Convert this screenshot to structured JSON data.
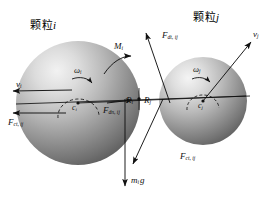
{
  "figure": {
    "type": "force-diagram",
    "background_color": "#ffffff",
    "sphere_fill_light": "#e8e8e8",
    "sphere_fill_dark": "#6a6a6a",
    "arrow_color": "#1a1a1a"
  },
  "titles": {
    "particle_i": "颗粒",
    "particle_i_index": "i",
    "particle_j": "颗粒",
    "particle_j_index": "j"
  },
  "particles": [
    {
      "id": "i",
      "label": "颗粒i",
      "center_label": "c",
      "center_sub": "i",
      "radius_label": "R",
      "radius_sub": "i",
      "cx": 78,
      "cy": 103,
      "r": 62
    },
    {
      "id": "j",
      "label": "颗粒j",
      "center_label": "c",
      "center_sub": "j",
      "radius_label": "R",
      "radius_sub": "j",
      "cx": 203,
      "cy": 101,
      "r": 44
    }
  ],
  "vectors": [
    {
      "name": "velocity-i",
      "symbol": "v",
      "sub": "i",
      "label": "v_i",
      "direction": "left",
      "from": [
        74,
        91
      ],
      "to": [
        12,
        91
      ]
    },
    {
      "name": "velocity-j",
      "symbol": "v",
      "sub": "j",
      "label": "v_j",
      "direction": "upper-right",
      "from": [
        203,
        101
      ],
      "to": [
        258,
        38
      ]
    },
    {
      "name": "contact-tangential-force-i",
      "symbol": "F",
      "sub": "ct, ij",
      "label": "F_ct, ij",
      "direction": "left",
      "from": [
        62,
        112
      ],
      "to": [
        12,
        112
      ]
    },
    {
      "name": "damping-normal-force-i",
      "symbol": "F",
      "sub": "dn, ij",
      "label": "F_dn, ij",
      "direction": "right",
      "from": [
        108,
        104
      ],
      "to": [
        131,
        100
      ]
    },
    {
      "name": "damping-tangential-force-j",
      "symbol": "F",
      "sub": "dt, ij",
      "label": "F_dt, ij",
      "direction": "upper-left",
      "from": [
        168,
        100
      ],
      "to": [
        144,
        32
      ]
    },
    {
      "name": "contact-tangential-force-j",
      "symbol": "F",
      "sub": "ct, ij",
      "label": "F_ct, ij",
      "direction": "lower-left",
      "from": [
        162,
        98
      ],
      "to": [
        131,
        165
      ]
    },
    {
      "name": "gravity-force-i",
      "symbol": "m",
      "sub": "i",
      "label": "m_i g",
      "suffix": "g",
      "direction": "down",
      "from": [
        125,
        100
      ],
      "to": [
        125,
        188
      ]
    },
    {
      "name": "torque-i",
      "symbol": "M",
      "sub": "i",
      "label": "M_i",
      "direction": "curved-arc",
      "arc_center": [
        78,
        103
      ]
    },
    {
      "name": "angular-velocity-i",
      "symbol": "ω",
      "sub": "i",
      "label": "ω_i",
      "direction": "counterclockwise"
    },
    {
      "name": "angular-velocity-j",
      "symbol": "ω",
      "sub": "j",
      "label": "ω_j",
      "direction": "counterclockwise"
    }
  ],
  "contact": {
    "point_label": "contact-point",
    "x": 139,
    "y": 99
  }
}
